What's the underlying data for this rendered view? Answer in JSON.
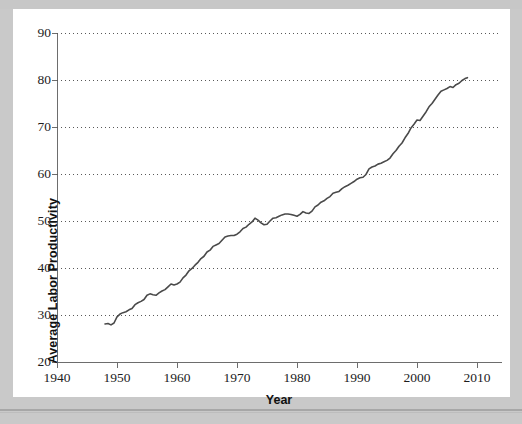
{
  "page": {
    "background_color": "#c9c9c9",
    "card_color": "#ffffff",
    "ghost_text": "",
    "rule_color": "#a7a7a7"
  },
  "chart_data": {
    "type": "line",
    "title": "",
    "xlabel": "Year",
    "ylabel": "Average Labor Productivity",
    "xlim": [
      1940,
      2014
    ],
    "ylim": [
      20,
      90
    ],
    "grid": true,
    "grid_axis": "y",
    "legend": false,
    "line_color": "#4a4a4a",
    "line_width": 1.6,
    "xticks": [
      1940,
      1950,
      1960,
      1970,
      1980,
      1990,
      2000,
      2010
    ],
    "xtick_labels": [
      "1940",
      "1950",
      "1960",
      "1970",
      "1980",
      "1990",
      "2000",
      "2010"
    ],
    "yticks": [
      20,
      30,
      40,
      50,
      60,
      70,
      80,
      90
    ],
    "ytick_labels": [
      "20",
      "30",
      "40",
      "50",
      "60",
      "70",
      "80",
      "90"
    ],
    "series": [
      {
        "name": "Average Labor Productivity",
        "x": [
          1948.0,
          1948.5,
          1949.0,
          1949.5,
          1950.0,
          1950.5,
          1951.0,
          1951.5,
          1952.0,
          1952.5,
          1953.0,
          1953.5,
          1954.0,
          1954.5,
          1955.0,
          1955.5,
          1956.0,
          1956.5,
          1957.0,
          1957.5,
          1958.0,
          1958.5,
          1959.0,
          1959.5,
          1960.0,
          1960.5,
          1961.0,
          1961.5,
          1962.0,
          1962.5,
          1963.0,
          1963.5,
          1964.0,
          1964.5,
          1965.0,
          1965.5,
          1966.0,
          1966.5,
          1967.0,
          1967.5,
          1968.0,
          1968.5,
          1969.0,
          1969.5,
          1970.0,
          1970.5,
          1971.0,
          1971.5,
          1972.0,
          1972.5,
          1973.0,
          1973.5,
          1974.0,
          1974.5,
          1975.0,
          1975.5,
          1976.0,
          1976.5,
          1977.0,
          1977.5,
          1978.0,
          1978.5,
          1979.0,
          1979.5,
          1980.0,
          1980.5,
          1981.0,
          1981.5,
          1982.0,
          1982.5,
          1983.0,
          1983.5,
          1984.0,
          1984.5,
          1985.0,
          1985.5,
          1986.0,
          1986.5,
          1987.0,
          1987.5,
          1988.0,
          1988.5,
          1989.0,
          1989.5,
          1990.0,
          1990.5,
          1991.0,
          1991.5,
          1992.0,
          1992.5,
          1993.0,
          1993.5,
          1994.0,
          1994.5,
          1995.0,
          1995.5,
          1996.0,
          1996.5,
          1997.0,
          1997.5,
          1998.0,
          1998.5,
          1999.0,
          1999.5,
          2000.0,
          2000.5,
          2001.0,
          2001.5,
          2002.0,
          2002.5,
          2003.0,
          2003.5,
          2004.0,
          2004.5,
          2005.0,
          2005.5,
          2006.0,
          2006.5,
          2007.0,
          2007.5,
          2008.0,
          2008.4
        ],
        "y": [
          28.1,
          28.2,
          27.9,
          28.3,
          29.6,
          30.2,
          30.5,
          30.7,
          31.1,
          31.4,
          32.2,
          32.6,
          32.9,
          33.3,
          34.2,
          34.5,
          34.3,
          34.2,
          34.7,
          35.1,
          35.4,
          36.0,
          36.6,
          36.4,
          36.6,
          37.0,
          37.9,
          38.5,
          39.4,
          39.9,
          40.6,
          41.2,
          42.0,
          42.5,
          43.4,
          43.8,
          44.6,
          44.9,
          45.2,
          45.9,
          46.6,
          46.8,
          46.9,
          46.9,
          47.2,
          47.7,
          48.4,
          48.7,
          49.3,
          49.8,
          50.6,
          50.2,
          49.6,
          49.2,
          49.3,
          50.0,
          50.6,
          50.7,
          51.0,
          51.3,
          51.5,
          51.5,
          51.4,
          51.2,
          51.0,
          51.4,
          52.0,
          51.7,
          51.6,
          52.1,
          53.0,
          53.4,
          54.0,
          54.3,
          54.8,
          55.2,
          55.9,
          56.1,
          56.3,
          56.9,
          57.3,
          57.6,
          58.0,
          58.4,
          58.9,
          59.2,
          59.3,
          59.9,
          61.1,
          61.5,
          61.7,
          62.1,
          62.3,
          62.6,
          62.9,
          63.4,
          64.3,
          65.0,
          65.9,
          66.6,
          67.7,
          68.6,
          69.8,
          70.6,
          71.5,
          71.4,
          72.3,
          73.2,
          74.3,
          75.0,
          75.9,
          76.8,
          77.6,
          77.9,
          78.2,
          78.6,
          78.4,
          79.0,
          79.3,
          79.9,
          80.3,
          80.5
        ]
      }
    ],
    "annotations": {
      "data_start_year": 1948,
      "data_end_year": 2008,
      "start_value": 28.1,
      "end_value": 80.5
    }
  }
}
